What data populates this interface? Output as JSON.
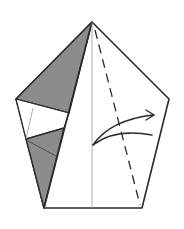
{
  "diagram": {
    "shape": "pentagon",
    "colors": {
      "paper_front": "#ffffff",
      "paper_back": "#8c8c8c",
      "outline": "#2a2a2a",
      "thin_line": "#9a9a9a"
    },
    "vertices": {
      "top": [
        92,
        22
      ],
      "left": [
        16,
        99
      ],
      "right": [
        169,
        99
      ],
      "bottom_left": [
        44,
        208
      ],
      "bottom_right": [
        142,
        208
      ]
    },
    "elements": [
      {
        "type": "valley-fold-line",
        "style": "dashed",
        "from": [
          95,
          30
        ],
        "to": [
          140,
          205
        ]
      },
      {
        "type": "center-crease",
        "style": "thin",
        "from": [
          92,
          22
        ],
        "to": [
          92,
          208
        ]
      },
      {
        "type": "fold-arrow",
        "direction": "right",
        "from": [
          93,
          145
        ],
        "to": [
          153,
          115
        ]
      }
    ]
  }
}
